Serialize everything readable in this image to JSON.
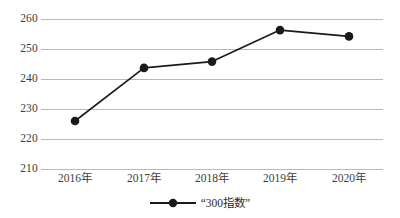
{
  "chart_data": {
    "type": "line",
    "title": "",
    "subtitle": "",
    "xlabel": "",
    "ylabel": "",
    "categories": [
      "2016年",
      "2017年",
      "2018年",
      "2019年",
      "2020年"
    ],
    "series": [
      {
        "name": "“300指数”",
        "values": [
          226.0,
          243.7,
          245.8,
          256.3,
          254.2
        ],
        "color": "#1a1a1a",
        "marker": "circle",
        "line_width": 1.6
      }
    ],
    "ylim": [
      210,
      260
    ],
    "yticks": [
      210,
      220,
      230,
      240,
      250,
      260
    ],
    "ytick_labels": [
      "210",
      "220",
      "230",
      "240",
      "250",
      "260"
    ],
    "grid": {
      "horizontal": true,
      "vertical": false,
      "color": "#b9b9b9"
    },
    "legend": {
      "position": "bottom",
      "entries": [
        "“300指数”"
      ]
    }
  },
  "colors": {
    "background": "#ffffff",
    "gridline": "#b9b9b9",
    "series": "#1a1a1a",
    "tick_text": "#3d3d3d"
  }
}
